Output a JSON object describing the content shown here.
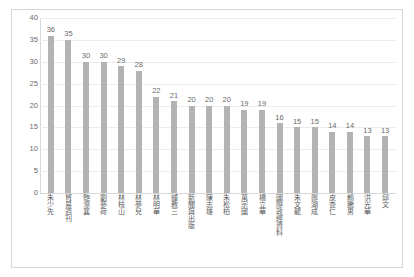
{
  "chart_data": {
    "type": "bar",
    "title": "",
    "subtitle": "",
    "xlabel": "",
    "ylabel": "",
    "ylim": [
      0,
      40
    ],
    "yticks": [
      0,
      5,
      10,
      15,
      20,
      25,
      30,
      35,
      40
    ],
    "grid": true,
    "legend": false,
    "legend_position": "none",
    "bar_color": "#b3b3b3",
    "categories": [
      "朱少先",
      "貿易週刊",
      "匏漈襄",
      "劉夢荷",
      "林枝山",
      "林夢兒",
      "林明華",
      "鍾教三",
      "新聞與出版",
      "陳志雄",
      "朱松柏",
      "萬宗國",
      "楊立華",
      "國際政經資料",
      "朱文龍",
      "鄭湖成",
      "皮查仁",
      "賴騰男",
      "洪光華",
      "邱文"
    ],
    "values": [
      36,
      35,
      30,
      30,
      29,
      28,
      22,
      21,
      20,
      20,
      20,
      19,
      19,
      16,
      15,
      15,
      14,
      14,
      13,
      13
    ]
  }
}
